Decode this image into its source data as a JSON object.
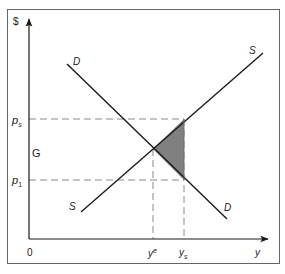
{
  "diagram": {
    "type": "supply-demand",
    "axes": {
      "y_label": "$",
      "x_label": "y",
      "origin_label": "0"
    },
    "price_labels": {
      "ps": {
        "main": "p",
        "sub": "s"
      },
      "p1": {
        "main": "p",
        "sub": "1"
      }
    },
    "quantity_labels": {
      "ye": {
        "main": "y",
        "sup": "e"
      },
      "ys": {
        "main": "y",
        "sub": "s"
      }
    },
    "region_label": "G",
    "curves": {
      "demand": {
        "label_top": "D",
        "label_bottom": "D"
      },
      "supply": {
        "label_top": "S",
        "label_bottom": "S"
      }
    },
    "colors": {
      "line": "#1a1a1a",
      "frame": "#555555",
      "dashed": "#888888",
      "shaded": "#808080"
    }
  }
}
